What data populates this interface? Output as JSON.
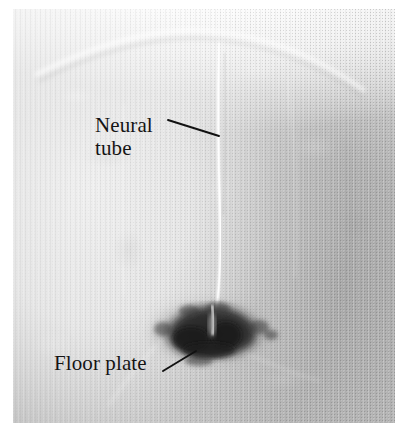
{
  "figure": {
    "type": "light micrograph",
    "background_color": "#ffffff",
    "plate": {
      "x": 13,
      "y": 9,
      "width": 382,
      "height": 414,
      "base_color": "#c6c6c6",
      "light_tone": "#f6f6f6",
      "dark_tone": "#a9a9a9"
    }
  },
  "annotations": [
    {
      "id": "neural-tube",
      "label_line_1": "Neural",
      "label_line_2": "tube",
      "label_text": "Neural tube",
      "text_color": "#141414",
      "leader": {
        "x1": 168,
        "y1": 120,
        "x2": 219,
        "y2": 136
      }
    },
    {
      "id": "floor-plate",
      "label_line_1": "Floor plate",
      "label_line_2": "",
      "label_text": "Floor plate",
      "text_color": "#141414",
      "leader": {
        "x1": 163,
        "y1": 371,
        "x2": 196,
        "y2": 351
      }
    }
  ],
  "structures": {
    "neural_tube_lumen": {
      "name": "neural tube lumen",
      "description": "thin bright vertical cleft running down the midline",
      "color": "#f4f4f4",
      "top_y": 40,
      "bottom_y": 312,
      "center_x": 218
    },
    "floor_plate_stain": {
      "name": "floor plate",
      "description": "dark ventral midline stain at base of neural tube",
      "color": "#2e2e2e",
      "center_x": 210,
      "center_y": 328,
      "width": 96,
      "height": 52
    },
    "dorsal_surface_arc": {
      "name": "dorsal surface",
      "description": "faint bright arc across the top of the section",
      "color": "#fbfbfb"
    }
  }
}
